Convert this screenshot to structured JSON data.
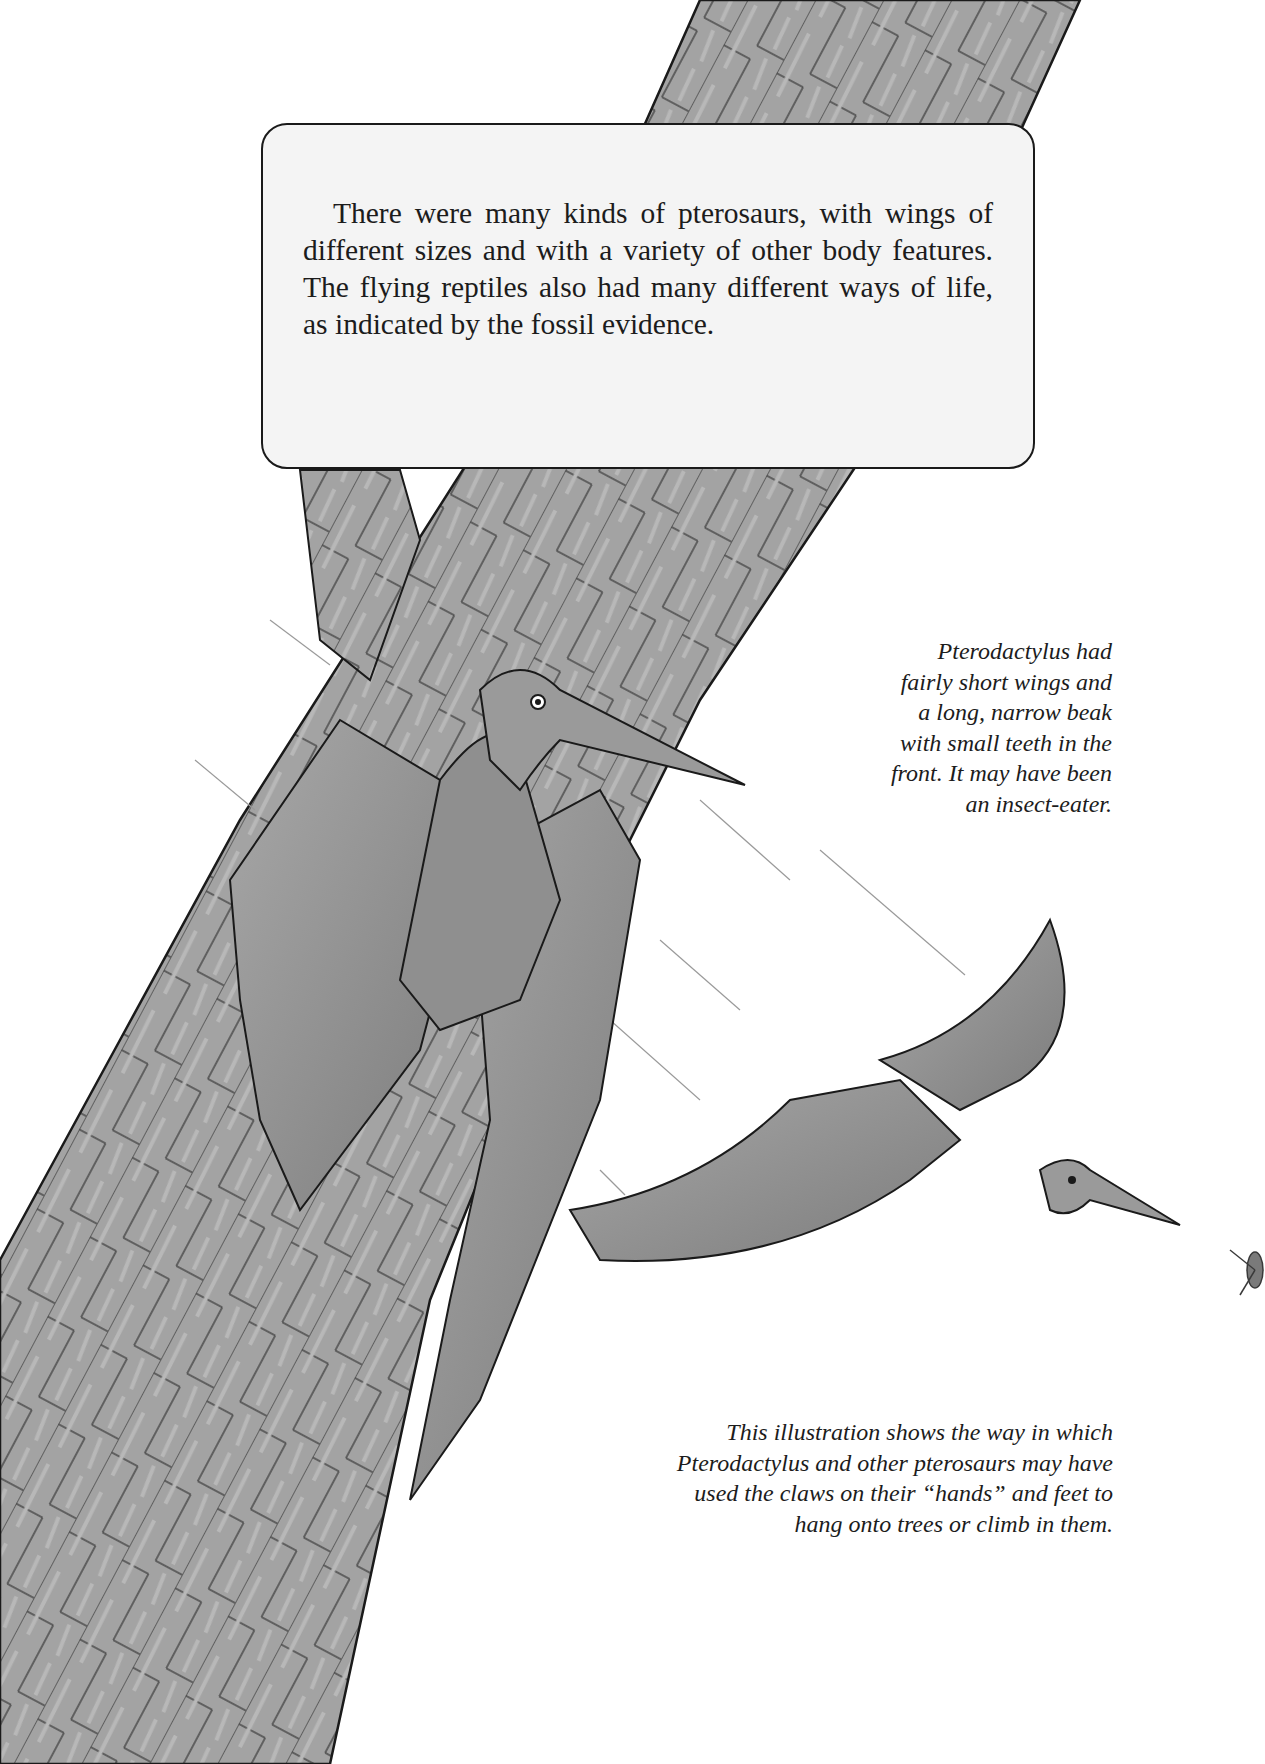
{
  "callout": {
    "text": "There were many kinds of pterosaurs, with wings of different sizes and with a variety of other body features. The flying reptiles also had many different ways of life, as indicated by the fossil evidence."
  },
  "captions": {
    "pterodactylus": {
      "lines": [
        "Pterodactylus had",
        "fairly short wings and",
        "a long, narrow beak",
        "with small teeth in the",
        "front. It may have been",
        "an insect-eater."
      ]
    },
    "illustration": {
      "lines": [
        "This illustration shows the way in which",
        "Pterodactylus and other pterosaurs may have",
        "used the claws on their “hands” and feet to",
        "hang onto trees or climb in them."
      ]
    }
  },
  "illustration": {
    "subjects": [
      "tree-trunk",
      "pterosaur-clinging",
      "pterosaur-flying",
      "insect"
    ],
    "colors": {
      "bark": "#9a9a9a",
      "bark_dark": "#6e6e6e",
      "outline": "#1a1a1a",
      "wing": "#8c8c8c",
      "paper": "#ffffff"
    }
  }
}
